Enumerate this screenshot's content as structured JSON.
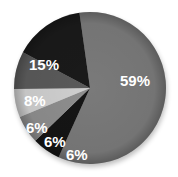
{
  "chart_data": {
    "type": "pie",
    "title": "",
    "categories": [
      "Slice A",
      "Slice B",
      "Slice C",
      "Slice D",
      "Slice E",
      "Slice F"
    ],
    "values": [
      59,
      6,
      6,
      6,
      8,
      15
    ],
    "labels": [
      "59%",
      "6%",
      "6%",
      "6%",
      "8%",
      "15%"
    ],
    "colors": [
      "#7a7a7a",
      "#151515",
      "#8e8e8e",
      "#cfcfcf",
      "#5a5a5a",
      "#1a1a1a"
    ],
    "legend": null,
    "start_angle_deg": -8,
    "direction": "clockwise"
  }
}
